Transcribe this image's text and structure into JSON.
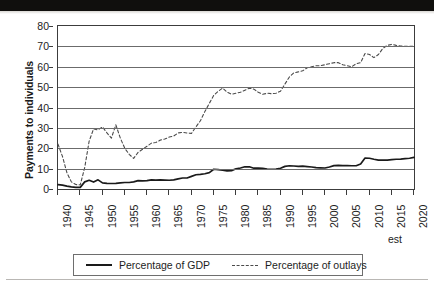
{
  "chart_data": {
    "type": "line",
    "title": "",
    "xlabel": "",
    "ylabel": "Payments to individuals",
    "ylim": [
      0,
      80
    ],
    "xlim": [
      1940,
      2020
    ],
    "ytick_labels": [
      "0",
      "10",
      "20",
      "30",
      "40",
      "50",
      "60",
      "70",
      "80"
    ],
    "ytick_values": [
      0,
      10,
      20,
      30,
      40,
      50,
      60,
      70,
      80
    ],
    "xtick_labels": [
      "1940",
      "1945",
      "1950",
      "1955",
      "1960",
      "1965",
      "1970",
      "1975",
      "1980",
      "1985",
      "1990",
      "1995",
      "2000",
      "2005",
      "2010",
      "2015",
      "2020"
    ],
    "xtick_values": [
      1940,
      1945,
      1950,
      1955,
      1960,
      1965,
      1970,
      1975,
      1980,
      1985,
      1990,
      1995,
      2000,
      2005,
      2010,
      2015,
      2020
    ],
    "x_axis_note": "est",
    "grid": true,
    "legend_position": "bottom",
    "x": [
      1940,
      1941,
      1942,
      1943,
      1944,
      1945,
      1946,
      1947,
      1948,
      1949,
      1950,
      1951,
      1952,
      1953,
      1954,
      1955,
      1956,
      1957,
      1958,
      1959,
      1960,
      1961,
      1962,
      1963,
      1964,
      1965,
      1966,
      1967,
      1968,
      1969,
      1970,
      1971,
      1972,
      1973,
      1974,
      1975,
      1976,
      1977,
      1978,
      1979,
      1980,
      1981,
      1982,
      1983,
      1984,
      1985,
      1986,
      1987,
      1988,
      1989,
      1990,
      1991,
      1992,
      1993,
      1994,
      1995,
      1996,
      1997,
      1998,
      1999,
      2000,
      2001,
      2002,
      2003,
      2004,
      2005,
      2006,
      2007,
      2008,
      2009,
      2010,
      2011,
      2012,
      2013,
      2014,
      2015,
      2016,
      2017,
      2018,
      2019,
      2020
    ],
    "series": [
      {
        "name": "Percentage of GDP",
        "style": "solid",
        "color": "#1a1a1a",
        "values": [
          2.1,
          1.9,
          1.4,
          1.0,
          0.8,
          0.8,
          3.5,
          4.3,
          3.4,
          4.5,
          3.0,
          2.8,
          2.7,
          2.8,
          3.0,
          3.2,
          3.2,
          3.5,
          4.1,
          4.0,
          4.1,
          4.5,
          4.4,
          4.5,
          4.4,
          4.3,
          4.5,
          5.0,
          5.4,
          5.4,
          6.2,
          7.0,
          7.2,
          7.5,
          8.0,
          9.7,
          9.5,
          9.2,
          8.9,
          9.0,
          9.9,
          10.3,
          10.9,
          10.9,
          10.2,
          10.2,
          10.1,
          9.8,
          9.7,
          9.8,
          10.2,
          11.1,
          11.4,
          11.3,
          11.1,
          11.2,
          11.0,
          10.8,
          10.5,
          10.4,
          10.3,
          10.8,
          11.5,
          11.6,
          11.5,
          11.5,
          11.4,
          11.4,
          12.3,
          15.2,
          15.1,
          14.6,
          14.2,
          14.2,
          14.2,
          14.4,
          14.6,
          14.7,
          14.9,
          15.1,
          15.5
        ]
      },
      {
        "name": "Percentage of outlays",
        "style": "dashed",
        "color": "#4a4a4a",
        "values": [
          22.0,
          16.0,
          8.0,
          3.5,
          2.2,
          2.0,
          10.5,
          23.5,
          29.5,
          29.0,
          30.5,
          27.5,
          25.0,
          31.5,
          25.0,
          20.0,
          17.0,
          15.0,
          18.0,
          19.5,
          21.0,
          22.5,
          22.8,
          24.0,
          24.5,
          25.5,
          26.0,
          27.5,
          27.8,
          27.5,
          27.3,
          30.5,
          33.5,
          38.0,
          42.0,
          46.0,
          48.0,
          49.5,
          47.5,
          46.5,
          47.0,
          47.5,
          48.5,
          49.5,
          49.0,
          47.5,
          46.5,
          47.0,
          46.8,
          47.0,
          48.0,
          51.5,
          55.0,
          57.0,
          57.5,
          58.0,
          59.5,
          60.0,
          60.5,
          60.5,
          61.0,
          61.5,
          62.0,
          62.0,
          61.0,
          60.5,
          60.0,
          61.5,
          62.0,
          66.5,
          66.0,
          64.5,
          66.0,
          69.0,
          70.5,
          71.0,
          70.5,
          70.2,
          70.0,
          70.0,
          70.0
        ]
      }
    ]
  },
  "legend": {
    "items": [
      {
        "label": "Percentage of GDP",
        "style": "solid"
      },
      {
        "label": "Percentage of outlays",
        "style": "dashed"
      }
    ]
  }
}
